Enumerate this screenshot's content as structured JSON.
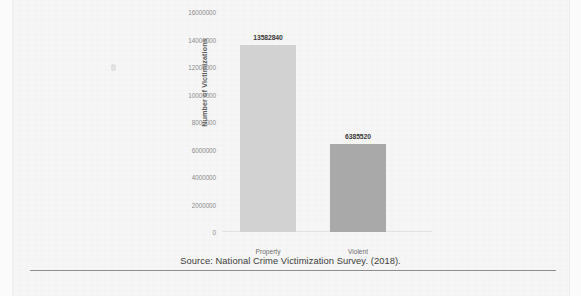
{
  "chart_data": {
    "type": "bar",
    "categories": [
      "Property",
      "Violent"
    ],
    "values": [
      13582840,
      6385520
    ],
    "value_labels": [
      "13582840",
      "6385520"
    ],
    "title": "",
    "xlabel": "",
    "ylabel": "Number of Victimizations",
    "ylim": [
      0,
      16000000
    ],
    "ytick_labels": [
      "16000000",
      "14000000",
      "12000000",
      "10000000",
      "8000000",
      "6000000",
      "4000000",
      "2000000",
      "0"
    ],
    "ytick_values": [
      16000000,
      14000000,
      12000000,
      10000000,
      8000000,
      6000000,
      4000000,
      2000000,
      0
    ],
    "grid": false,
    "legend": "none",
    "bar_colors": [
      "#d2d2d2",
      "#a9a9a9"
    ]
  },
  "caption": {
    "source_text": "Source: National Crime Victimization Survey. (2018)."
  }
}
